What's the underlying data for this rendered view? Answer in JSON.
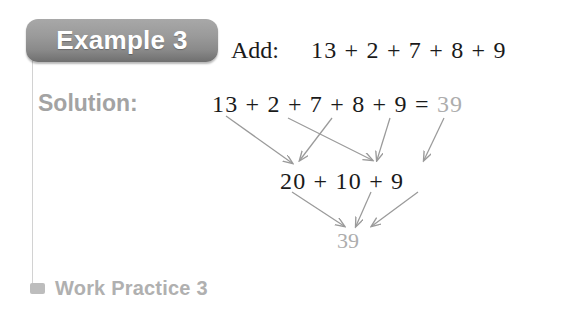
{
  "example": {
    "badge_label": "Example 3",
    "prompt_label": "Add:",
    "prompt_expression": "13 + 2 + 7 + 8 + 9"
  },
  "solution": {
    "label": "Solution:",
    "row_top_expression": "13 + 2 + 7 + 8 + 9 = ",
    "row_top_result": "39",
    "row_middle_expression": "20 + 10 + 9",
    "row_bottom_result": "39"
  },
  "footer": {
    "bullet_icon": "square-bullet-icon",
    "label": "Work Practice 3"
  },
  "colors": {
    "badge_gradient_top": "#a8a8a8",
    "badge_gradient_bottom": "#6f6f6f",
    "badge_text": "#ffffff",
    "solution_label": "#a3a3a3",
    "equation_text": "#1a1a1a",
    "result_gray": "#adadad",
    "arrow": "#9a9a9a",
    "rule": "#d2d2d2",
    "background": "#ffffff"
  },
  "arrows": {
    "description": "grouping arrows from addends to partial sums and to final total",
    "upper": [
      {
        "from": "13",
        "to": "20",
        "x1": 226,
        "y1": 116,
        "x2": 292,
        "y2": 163
      },
      {
        "from": "2",
        "to": "10",
        "x1": 288,
        "y1": 118,
        "x2": 372,
        "y2": 160
      },
      {
        "from": "7",
        "to": "20",
        "x1": 332,
        "y1": 118,
        "x2": 300,
        "y2": 160
      },
      {
        "from": "8",
        "to": "10",
        "x1": 390,
        "y1": 118,
        "x2": 377,
        "y2": 160
      },
      {
        "from": "9",
        "to": "9",
        "x1": 444,
        "y1": 118,
        "x2": 424,
        "y2": 160
      }
    ],
    "lower": [
      {
        "from": "20",
        "to": "39",
        "x1": 292,
        "y1": 192,
        "x2": 344,
        "y2": 226
      },
      {
        "from": "10",
        "to": "39",
        "x1": 371,
        "y1": 192,
        "x2": 356,
        "y2": 226
      },
      {
        "from": "9",
        "to": "39",
        "x1": 418,
        "y1": 192,
        "x2": 372,
        "y2": 226
      }
    ]
  }
}
